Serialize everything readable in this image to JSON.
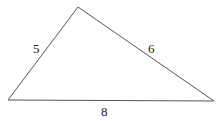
{
  "diagram": {
    "type": "triangle",
    "vertices": {
      "top": [
        78,
        7
      ],
      "left": [
        8,
        100
      ],
      "right": [
        214,
        101
      ]
    },
    "sides": [
      {
        "name": "left-side",
        "label": "5",
        "from": "left",
        "to": "top"
      },
      {
        "name": "right-side",
        "label": "6",
        "from": "top",
        "to": "right"
      },
      {
        "name": "base",
        "label": "8",
        "from": "left",
        "to": "right"
      }
    ],
    "stroke_color": "#555555",
    "label_color": "#222222"
  }
}
